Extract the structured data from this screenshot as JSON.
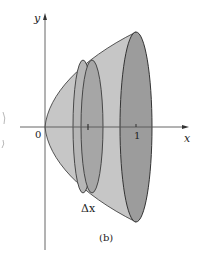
{
  "figure": {
    "caption": "(b)",
    "axes": {
      "x_label": "x",
      "y_label": "y",
      "origin_label": "0",
      "tick_label_one": "1"
    },
    "slice_label": "Δx",
    "shading": {
      "solid_fill": "#c4c4c4",
      "rim_fill": "#9a9a9a",
      "slice_fill": "#a9a9a9",
      "stroke": "#3a3a3a"
    }
  }
}
